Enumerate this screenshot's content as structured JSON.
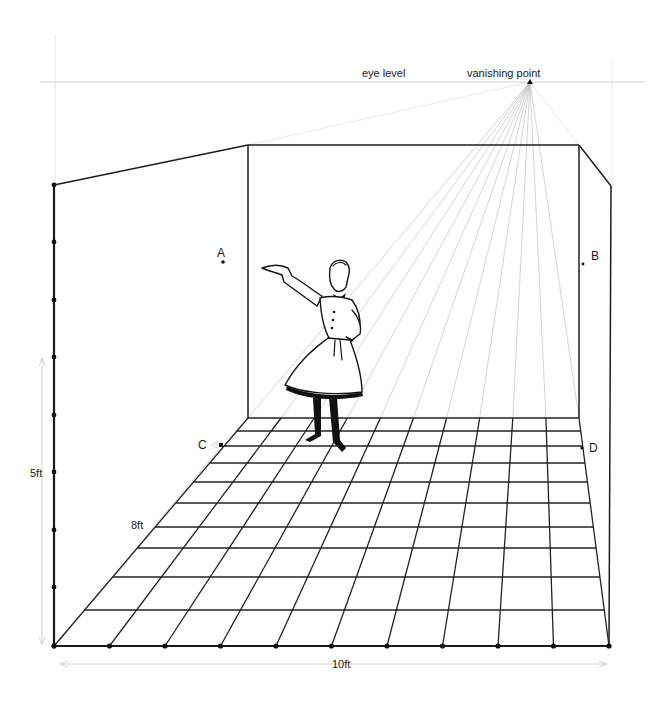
{
  "figure": {
    "type": "one-point perspective room diagram",
    "labels": {
      "eye_level": "eye level",
      "vanishing_point": "vanishing point",
      "point_a": "A",
      "point_b": "B",
      "point_c": "C",
      "point_d": "D",
      "height_dim": "5ft",
      "depth_dim": "8ft",
      "width_dim": "10ft"
    },
    "colors": {
      "ink": "#1a1a1a",
      "guide": "#c9c9c9",
      "background": "#ffffff"
    },
    "geometry": {
      "vanishing_point": [
        530,
        82
      ],
      "eye_level_y": 82,
      "back_wall": {
        "left": 248,
        "right": 579,
        "top": 145,
        "bottom": 418
      },
      "front_left_corner": [
        54,
        646
      ],
      "front_right_corner": [
        609,
        646
      ],
      "front_left_top": [
        54,
        185
      ],
      "front_right_top": [
        611,
        186
      ],
      "floor_columns": 10,
      "floor_rows": 10,
      "height_ticks_y": [
        185,
        242,
        300,
        357,
        415,
        472,
        530,
        587,
        646
      ],
      "floor_row_y": [
        418,
        431,
        446,
        463,
        482,
        503,
        527,
        548,
        577,
        610,
        646
      ]
    }
  }
}
